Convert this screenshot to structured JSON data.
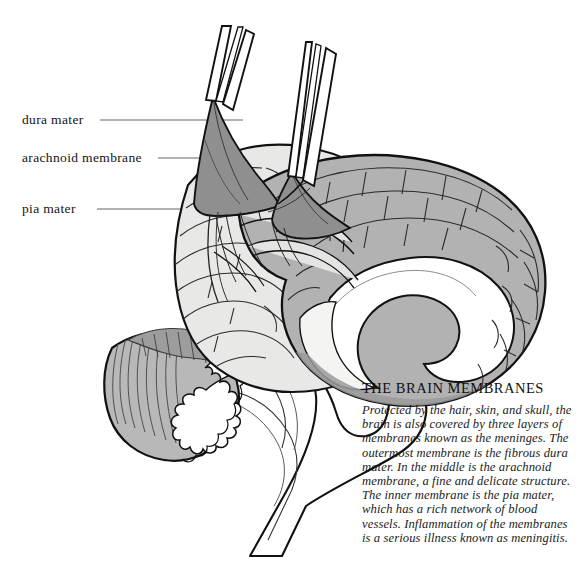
{
  "figure": {
    "title": "THE BRAIN MEMBRANES",
    "background_color": "#ffffff"
  },
  "labels": [
    {
      "id": "dura",
      "text": "dura mater",
      "leader_from_x": 100,
      "leader_to_x": 243,
      "leader_y": 120
    },
    {
      "id": "arachnoid",
      "text": "arachnoid membrane",
      "leader_from_x": 158,
      "leader_to_x": 268,
      "leader_y": 158
    },
    {
      "id": "pia",
      "text": "pia mater",
      "leader_from_x": 97,
      "leader_to_x": 230,
      "leader_y": 209
    }
  ],
  "caption": {
    "title": "THE BRAIN MEMBRANES",
    "body": "Protected by the hair, skin, and skull, the brain is also covered by three layers of membranes known as the meninges. The outermost membrane is the fibrous dura mater. In the middle is the arachnoid membrane, a fine and delicate structure. The inner membrane is the pia mater, which has a rich network of blood vessels. Inflammation of the membranes is a serious illness known as meningitis."
  },
  "colors": {
    "ink": "#1a1a1a",
    "outline": "#111111",
    "cortex_lateral": "#e8e8e6",
    "cortex_medial": "#b2b2b2",
    "cortex_medial_dark": "#a3a3a3",
    "membrane_flap": "#8f8f8f",
    "membrane_flap_light": "#a8a8a8",
    "cerebellum": "#b8b8b8",
    "cerebellum_folia": "#9d9d9d",
    "white_matter": "#ffffff",
    "white_matter_shade": "#f0f0ee",
    "brainstem": "#ffffff",
    "leader_line": "#555555"
  },
  "structures": [
    "cerebral cortex (lateral surface)",
    "cerebral cortex (medial cut surface)",
    "corpus callosum",
    "cerebellum with arbor vitae",
    "brainstem",
    "dura mater flap",
    "arachnoid membrane flap",
    "pia mater",
    "blood vessels"
  ]
}
